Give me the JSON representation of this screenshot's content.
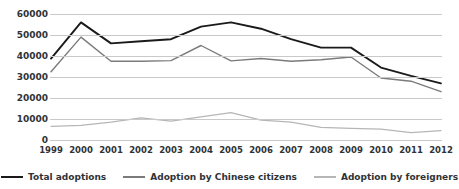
{
  "chart_data": {
    "type": "line",
    "title": "",
    "xlabel": "",
    "ylabel": "",
    "categories": [
      "1999",
      "2000",
      "2001",
      "2002",
      "2003",
      "2004",
      "2005",
      "2006",
      "2007",
      "2008",
      "2009",
      "2010",
      "2011",
      "2012"
    ],
    "ylim": [
      0,
      60000
    ],
    "ytick_labels": [
      "0",
      "10000",
      "20000",
      "30000",
      "40000",
      "50000",
      "60000"
    ],
    "ytick_values": [
      0,
      10000,
      20000,
      30000,
      40000,
      50000,
      60000
    ],
    "grid": true,
    "legend_position": "bottom",
    "series": [
      {
        "name": "Total adoptions",
        "color": "#1a1a1a",
        "values": [
          38800,
          56000,
          46000,
          47000,
          48000,
          54000,
          56000,
          53000,
          48000,
          44000,
          44000,
          34500,
          30500,
          27000
        ]
      },
      {
        "name": "Adoption by Chinese citizens",
        "color": "#7b7b7b",
        "values": [
          32500,
          49000,
          37500,
          37500,
          37800,
          45000,
          37700,
          38800,
          37500,
          38200,
          39500,
          29500,
          28000,
          23000
        ]
      },
      {
        "name": "Adoption by foreigners",
        "color": "#b6b6b6",
        "values": [
          6500,
          7000,
          8500,
          10500,
          9000,
          11000,
          13000,
          9500,
          8500,
          6000,
          5500,
          5200,
          3500,
          4500
        ]
      }
    ]
  },
  "legend": {
    "items": [
      {
        "label": "Total adoptions",
        "color": "#1a1a1a"
      },
      {
        "label": "Adoption by Chinese citizens",
        "color": "#7b7b7b"
      },
      {
        "label": "Adoption by foreigners",
        "color": "#b6b6b6"
      }
    ]
  },
  "colors": {
    "gridline": "#c9c9c9",
    "text": "#2f3336",
    "background": "#ffffff"
  }
}
